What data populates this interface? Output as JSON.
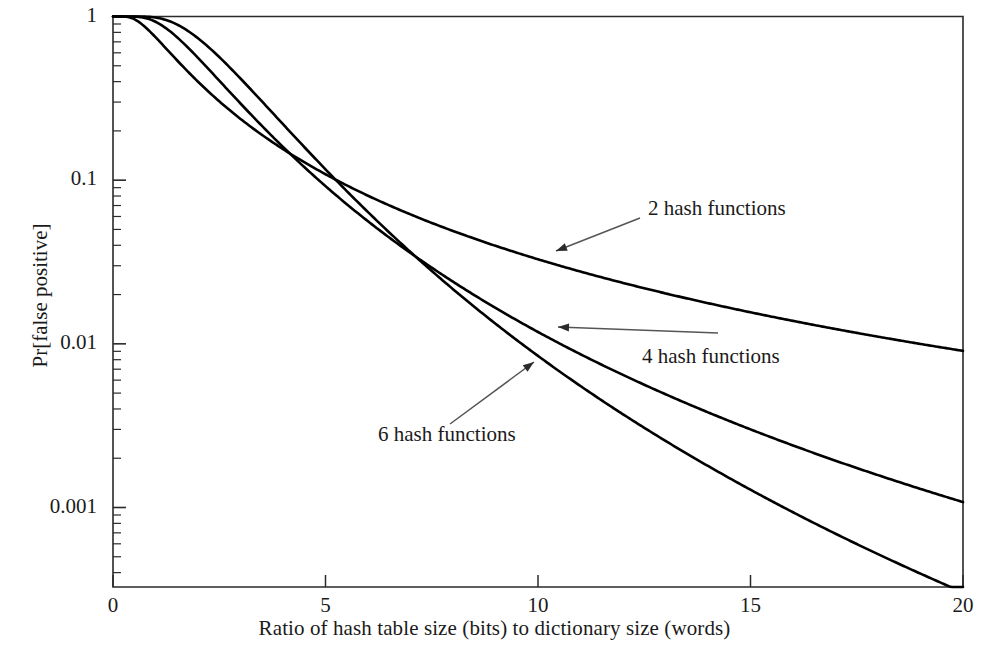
{
  "chart_data": {
    "type": "line",
    "title": "",
    "subtitle": "",
    "xlabel": "Ratio of hash table size (bits) to dictionary size (words)",
    "ylabel": "Pr[false positive]",
    "xlim": [
      0,
      20
    ],
    "ylim": [
      0.0003,
      1
    ],
    "yscale": "log",
    "xscale": "linear",
    "grid": false,
    "legend": "annotations-with-arrows",
    "xticks": [
      0,
      5,
      10,
      15,
      20
    ],
    "xtick_labels": [
      "0",
      "5",
      "10",
      "15",
      "20"
    ],
    "yticks": [
      1,
      0.1,
      0.01,
      0.001
    ],
    "ytick_labels": [
      "1",
      "0.1",
      "0.01",
      "0.001"
    ],
    "minor_ticks": true,
    "formula": "Pr = (1 - e^(-k/m))^k",
    "x": [
      0,
      1,
      2,
      3,
      4,
      5,
      6,
      7,
      8,
      9,
      10,
      11,
      12,
      13,
      14,
      15,
      16,
      17,
      18,
      19,
      20
    ],
    "series": [
      {
        "name": "2 hash functions",
        "k": 2,
        "annotation": "2 hash functions",
        "values": [
          1.0,
          0.4,
          0.2383,
          0.1549,
          0.1083,
          0.0799,
          0.0613,
          0.0485,
          0.0393,
          0.0325,
          0.0273,
          0.0233,
          0.0201,
          0.0175,
          0.0154,
          0.0137,
          0.0122,
          0.0109,
          0.0099,
          0.009,
          0.0082
        ]
      },
      {
        "name": "4 hash functions",
        "k": 4,
        "annotation": "4 hash functions",
        "values": [
          1.0,
          0.9214,
          0.4612,
          0.2178,
          0.108,
          0.0561,
          0.0306,
          0.0174,
          0.0103,
          0.0063,
          0.004,
          0.0026,
          0.0017,
          0.0012,
          0.00082,
          0.00059,
          0.00043,
          0.00032,
          0.00024,
          0.00019,
          0.00014
        ]
      },
      {
        "name": "6 hash functions",
        "k": 6,
        "annotation": "6 hash functions",
        "values": [
          1.0,
          0.9949,
          0.7001,
          0.3063,
          0.1313,
          0.0561,
          0.0245,
          0.0111,
          0.0052,
          0.0025,
          0.00128,
          0.00067,
          0.00036,
          0.0002,
          0.00012,
          6.9e-05,
          4.2e-05,
          2.6e-05,
          1.6e-05,
          1.1e-05,
          6.9e-06
        ]
      }
    ],
    "annotations": [
      {
        "label": "2 hash functions",
        "text_x": 648,
        "text_y": 196,
        "arrow_from_x": 640,
        "arrow_from_y": 218,
        "arrow_to_x": 556,
        "arrow_to_y": 251
      },
      {
        "label": "4 hash functions",
        "text_x": 642,
        "text_y": 344,
        "arrow_from_x": 718,
        "arrow_from_y": 333,
        "arrow_to_x": 558,
        "arrow_to_y": 327
      },
      {
        "label": "6 hash functions",
        "text_x": 378,
        "text_y": 422,
        "arrow_from_x": 450,
        "arrow_from_y": 424,
        "arrow_to_x": 534,
        "arrow_to_y": 362
      }
    ],
    "colors": {
      "line": "#000000",
      "axis": "#2a2a2a",
      "text": "#1a1a1a",
      "arrow": "#555555",
      "background": "#ffffff"
    }
  }
}
